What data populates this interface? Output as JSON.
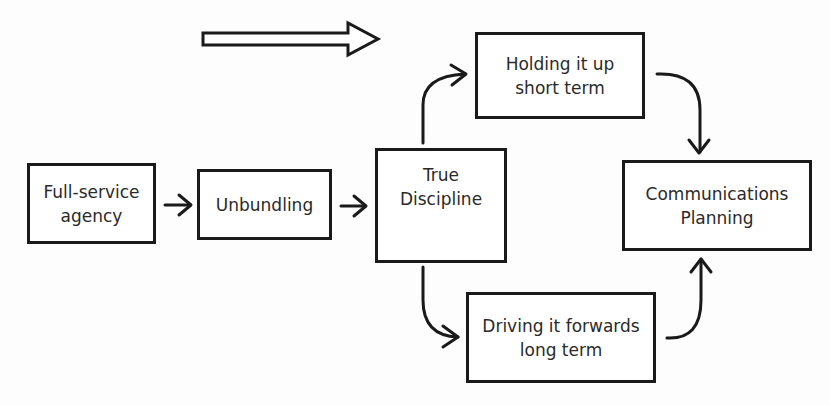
{
  "diagram": {
    "direction_arrow": "right-arrow",
    "nodes": [
      {
        "id": "full-service",
        "lines": [
          "Full-service",
          "agency"
        ]
      },
      {
        "id": "unbundling",
        "lines": [
          "Unbundling"
        ]
      },
      {
        "id": "true-discipline",
        "lines": [
          "True",
          "Discipline"
        ]
      },
      {
        "id": "holding",
        "lines": [
          "Holding it up",
          "short term"
        ]
      },
      {
        "id": "driving",
        "lines": [
          "Driving it forwards",
          "long term"
        ]
      },
      {
        "id": "communications",
        "lines": [
          "Communications",
          "Planning"
        ]
      }
    ],
    "edges": [
      {
        "from": "full-service",
        "to": "unbundling"
      },
      {
        "from": "unbundling",
        "to": "true-discipline"
      },
      {
        "from": "true-discipline",
        "to": "holding"
      },
      {
        "from": "true-discipline",
        "to": "driving"
      },
      {
        "from": "holding",
        "to": "communications"
      },
      {
        "from": "driving",
        "to": "communications"
      }
    ],
    "colors": {
      "stroke": "#1a1a1a",
      "text": "#2a2a2a",
      "background": "#fdfdfd"
    }
  }
}
